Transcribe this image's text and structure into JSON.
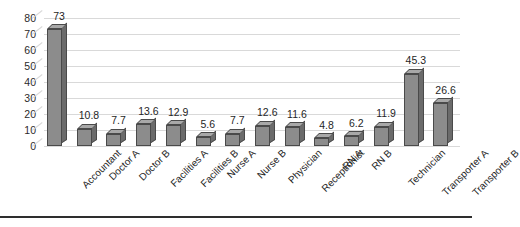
{
  "chart_data": {
    "type": "bar",
    "title": "",
    "subtitle": "",
    "xlabel": "",
    "ylabel": "",
    "categories": [
      "Accountant",
      "Doctor A",
      "Doctor B",
      "Facilities A",
      "Facilities B",
      "Nurse A",
      "Nurse B",
      "Physician",
      "Receptionist",
      "RN A",
      "RN B",
      "Technician",
      "Transporter A",
      "Transporter B"
    ],
    "values": [
      73,
      10.8,
      7.7,
      13.6,
      12.9,
      5.6,
      7.7,
      12.6,
      11.6,
      4.8,
      6.2,
      11.9,
      45.3,
      26.6
    ],
    "data_labels": [
      "73",
      "10.8",
      "7.7",
      "13.6",
      "12.9",
      "5.6",
      "7.7",
      "12.6",
      "11.6",
      "4.8",
      "6.2",
      "11.9",
      "45.3",
      "26.6"
    ],
    "ylim": [
      0,
      80
    ],
    "ytick_step": 10,
    "yticks": [
      0,
      10,
      20,
      30,
      40,
      50,
      60,
      70,
      80
    ],
    "ytick_labels": [
      "0",
      "10",
      "20",
      "30",
      "40",
      "50",
      "60",
      "70",
      "80"
    ],
    "grid": true,
    "grid_axis": "y",
    "legend": false,
    "legend_position": "none",
    "bar_style": "3d",
    "xtick_rotation": -45,
    "colors": {
      "bar_front": "#8c8c8c",
      "bar_side": "#6b6b6b",
      "bar_top": "#a8a8a8",
      "bar_edge": "#4a4a4a",
      "gridline": "#d9d9d9",
      "text": "#1f1f1f",
      "background": "#ffffff",
      "footer_rule": "#2e2e2e"
    }
  }
}
